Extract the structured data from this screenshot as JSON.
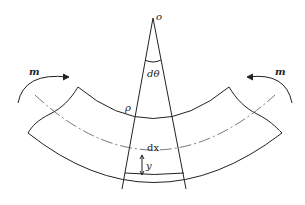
{
  "figure": {
    "type": "pure-bending-beam-element",
    "labels": {
      "origin": "o",
      "angle": "dθ",
      "radius": "ρ",
      "length": "dx",
      "distance": "y",
      "moment_left": "m",
      "moment_right": "m"
    },
    "colors": {
      "stroke": "#222222",
      "neutral_axis": "#555555",
      "background": "#ffffff"
    }
  }
}
